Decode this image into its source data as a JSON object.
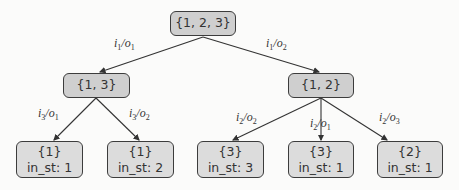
{
  "diagram": {
    "type": "tree",
    "root": {
      "id": "n0",
      "label": "{1, 2, 3}"
    },
    "nodes": [
      {
        "id": "n0",
        "label": "{1, 2, 3}",
        "kind": "inner"
      },
      {
        "id": "n1",
        "label": "{1, 3}",
        "kind": "inner"
      },
      {
        "id": "n2",
        "label": "{1, 2}",
        "kind": "inner"
      },
      {
        "id": "l1",
        "label": "{1}",
        "state": "in_st: 1",
        "kind": "leaf"
      },
      {
        "id": "l2",
        "label": "{1}",
        "state": "in_st: 2",
        "kind": "leaf"
      },
      {
        "id": "l3",
        "label": "{3}",
        "state": "in_st: 3",
        "kind": "leaf"
      },
      {
        "id": "l4",
        "label": "{3}",
        "state": "in_st: 1",
        "kind": "leaf"
      },
      {
        "id": "l5",
        "label": "{2}",
        "state": "in_st: 1",
        "kind": "leaf"
      }
    ],
    "edges": [
      {
        "from": "n0",
        "to": "n1",
        "input": "i",
        "input_sub": "1",
        "output": "o",
        "output_sub": "1"
      },
      {
        "from": "n0",
        "to": "n2",
        "input": "i",
        "input_sub": "1",
        "output": "o",
        "output_sub": "2"
      },
      {
        "from": "n1",
        "to": "l1",
        "input": "i",
        "input_sub": "3",
        "output": "o",
        "output_sub": "1"
      },
      {
        "from": "n1",
        "to": "l2",
        "input": "i",
        "input_sub": "3",
        "output": "o",
        "output_sub": "2"
      },
      {
        "from": "n2",
        "to": "l3",
        "input": "i",
        "input_sub": "2",
        "output": "o",
        "output_sub": "2"
      },
      {
        "from": "n2",
        "to": "l4",
        "input": "i",
        "input_sub": "2",
        "output": "o",
        "output_sub": "1"
      },
      {
        "from": "n2",
        "to": "l5",
        "input": "i",
        "input_sub": "2",
        "output": "o",
        "output_sub": "3"
      }
    ],
    "colors": {
      "node_fill": "#d9d9d9",
      "node_border": "#3c3c3c",
      "edge": "#333333",
      "background": "#fbfbfa"
    }
  }
}
